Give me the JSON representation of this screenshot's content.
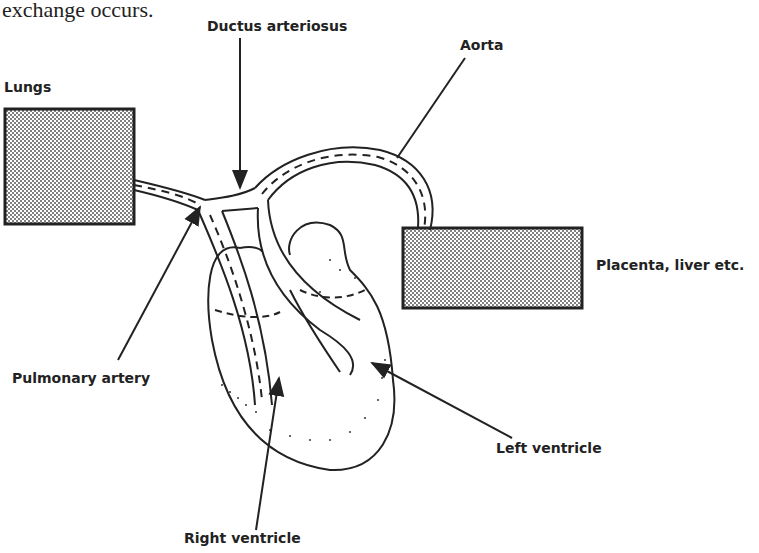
{
  "caption": "exchange occurs.",
  "labels": {
    "ductus_arteriosus": "Ductus arteriosus",
    "aorta": "Aorta",
    "lungs": "Lungs",
    "placenta": "Placenta, liver etc.",
    "pulmonary_artery": "Pulmonary artery",
    "left_ventricle": "Left ventricle",
    "right_ventricle": "Right ventricle"
  },
  "colors": {
    "ink": "#222222",
    "background": "#ffffff",
    "stipple_fill": "#bdbdbd"
  }
}
